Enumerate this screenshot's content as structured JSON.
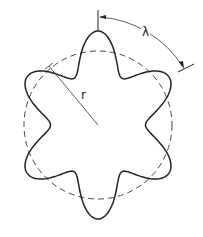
{
  "diagram": {
    "labels": {
      "radius": "r",
      "wavelength": "λ"
    },
    "shape": {
      "center": [
        98,
        125
      ],
      "mean_radius": 74,
      "amplitude": 20,
      "lobes": 6
    },
    "colors": {
      "stroke": "#222222",
      "background": "#ffffff"
    }
  }
}
